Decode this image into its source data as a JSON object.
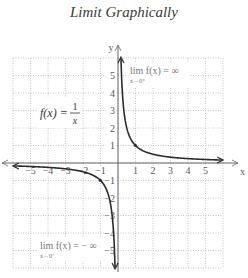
{
  "title": "Limit Graphically",
  "chart_data": {
    "type": "line",
    "title": "Limit Graphically",
    "xlabel": "x",
    "ylabel": "y",
    "xlim": [
      -6,
      6
    ],
    "ylim": [
      -6,
      6
    ],
    "grid": true,
    "x_ticks": [
      "−5",
      "−4",
      "−3",
      "−2",
      "−1",
      "1",
      "2",
      "3",
      "4",
      "5"
    ],
    "y_ticks": [
      "5",
      "4",
      "3",
      "2",
      "1",
      "−1",
      "−2",
      "−3",
      "−4",
      "−5"
    ],
    "series": [
      {
        "name": "f(x) = 1/x",
        "function": "1/x",
        "points_right": [
          [
            0.17,
            6
          ],
          [
            0.25,
            4
          ],
          [
            0.333,
            3
          ],
          [
            0.5,
            2
          ],
          [
            1,
            1
          ],
          [
            2,
            0.5
          ],
          [
            3,
            0.333
          ],
          [
            4,
            0.25
          ],
          [
            5,
            0.2
          ],
          [
            5.9,
            0.17
          ]
        ],
        "points_left": [
          [
            -5.9,
            -0.17
          ],
          [
            -5,
            -0.2
          ],
          [
            -4,
            -0.25
          ],
          [
            -3,
            -0.333
          ],
          [
            -2,
            -0.5
          ],
          [
            -1,
            -1
          ],
          [
            -0.5,
            -2
          ],
          [
            -0.333,
            -3
          ],
          [
            -0.25,
            -4
          ],
          [
            -0.17,
            -6
          ]
        ]
      }
    ],
    "annotations": [
      {
        "text": "f(x) = 1/x",
        "position": "left upper"
      },
      {
        "text": "lim f(x) = ∞",
        "sub": "x→0⁺",
        "position": "right upper"
      },
      {
        "text": "lim f(x) = − ∞",
        "sub": "x→0⁻",
        "position": "left lower"
      }
    ]
  },
  "labels": {
    "fx_lhs": "f(x) =",
    "fx_num": "1",
    "fx_den": "x",
    "lim_right": "lim f(x) = ∞",
    "lim_right_sub": "x→0⁺",
    "lim_left": "lim f(x) = − ∞",
    "lim_left_sub": "x→0⁻",
    "axis_x": "x",
    "axis_y": "y"
  },
  "colors": {
    "curve": "#2b2b2b",
    "grid": "#9a9a9a",
    "axis": "#666666",
    "text": "#555555"
  }
}
